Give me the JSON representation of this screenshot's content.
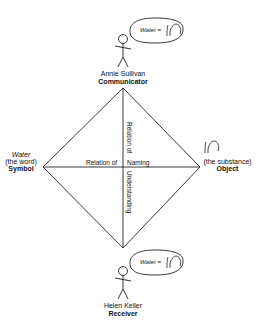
{
  "diagram": {
    "type": "semiotic-diamond",
    "top": {
      "name": "Annie Sullivan",
      "role": "Communicator",
      "bubble": {
        "word": "Water",
        "equals": "=",
        "sign_icon": "hand-sign-icon"
      }
    },
    "bottom": {
      "name": "Helen Keller",
      "role": "Receiver",
      "bubble": {
        "word": "Water",
        "equals": "=",
        "sign_icon": "hand-sign-icon"
      }
    },
    "left": {
      "word": "Water",
      "note": "(the word)",
      "role": "Symbol"
    },
    "right": {
      "icon": "hand-sign-icon",
      "note": "(the substance)",
      "role": "Object"
    },
    "axes": {
      "horizontal_left": "Relation of",
      "horizontal_right": "Naming",
      "vertical_top": "Relation of",
      "vertical_bottom": "Understanding"
    },
    "colors": {
      "stroke": "#222222",
      "background": "#ffffff"
    }
  }
}
